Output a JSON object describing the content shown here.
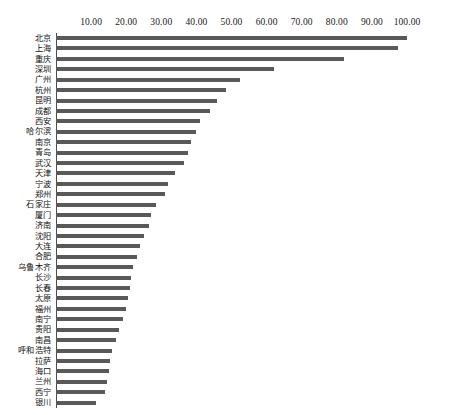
{
  "chart_data": {
    "type": "bar",
    "orientation": "horizontal",
    "title": "",
    "subtitle": "",
    "xlabel": "",
    "ylabel": "",
    "xlim": [
      0,
      100
    ],
    "ylim": null,
    "grid": false,
    "legend": null,
    "legend_position": "none",
    "axis_position": "top",
    "tick_format": "0.00",
    "bar_color": "#595959",
    "axis_color": "#4d4d4d",
    "tick_labels": [
      "10.00",
      "20.00",
      "30.00",
      "40.00",
      "50.00",
      "60.00",
      "70.00",
      "80.00",
      "90.00",
      "100.00"
    ],
    "tick_values": [
      10,
      20,
      30,
      40,
      50,
      60,
      70,
      80,
      90,
      100
    ],
    "categories": [
      "北京",
      "上海",
      "重庆",
      "深圳",
      "广州",
      "杭州",
      "昆明",
      "成都",
      "西安",
      "哈尔滨",
      "南京",
      "青岛",
      "武汉",
      "天津",
      "宁波",
      "郑州",
      "石家庄",
      "厦门",
      "济南",
      "沈阳",
      "大连",
      "合肥",
      "乌鲁木齐",
      "长沙",
      "长春",
      "太原",
      "福州",
      "南宁",
      "贵阳",
      "南昌",
      "呼和浩特",
      "拉萨",
      "海口",
      "兰州",
      "西宁",
      "银川"
    ],
    "values": [
      100.0,
      97.5,
      82.0,
      62.0,
      52.5,
      48.5,
      46.0,
      44.0,
      41.0,
      40.0,
      38.5,
      37.5,
      36.5,
      34.0,
      32.0,
      31.0,
      28.5,
      27.0,
      26.5,
      25.0,
      24.0,
      23.0,
      22.0,
      21.5,
      21.0,
      20.5,
      20.0,
      19.0,
      18.0,
      17.0,
      16.0,
      15.5,
      15.0,
      14.5,
      14.0,
      11.5
    ]
  }
}
